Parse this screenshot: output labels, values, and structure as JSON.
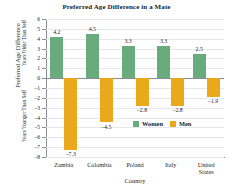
{
  "chart_data": {
    "type": "bar",
    "title": "Preferred Age Difference in a Mate",
    "xlabel": "Country",
    "ylabel": "Preferred Age Difference",
    "ylabel_upper": "Years Older Than Self",
    "ylabel_lower": "Years Younger Than Self",
    "categories": [
      "Zambia",
      "Colombia",
      "Poland",
      "Italy",
      "United States"
    ],
    "series": [
      {
        "name": "Women",
        "color": "#6aab7e",
        "values": [
          4.2,
          4.5,
          3.3,
          3.3,
          2.5
        ]
      },
      {
        "name": "Men",
        "color": "#eaa81c",
        "values": [
          -7.3,
          -4.5,
          -2.8,
          -2.8,
          -1.9
        ]
      }
    ],
    "ylim": [
      -8,
      6
    ],
    "yticks": [
      6,
      5,
      4,
      3,
      2,
      1,
      0,
      -1,
      -2,
      -3,
      -4,
      -5,
      -6,
      -7,
      -8
    ],
    "ytick_labels": [
      "6",
      "5",
      "4",
      "3",
      "2",
      "1",
      "0",
      "–1",
      "–2",
      "–3",
      "–4",
      "–5",
      "–6",
      "–7",
      "–8"
    ],
    "value_labels": {
      "women": [
        "4.2",
        "4.5",
        "3.3",
        "3.3",
        "2.5"
      ],
      "men": [
        "–7.3",
        "–4.5",
        "–2.8",
        "–2.8",
        "–1.9"
      ]
    },
    "category_lines": [
      [
        "Zambia"
      ],
      [
        "Colombia"
      ],
      [
        "Poland"
      ],
      [
        "Italy"
      ],
      [
        "United",
        "States"
      ]
    ],
    "grid": true,
    "legend_position": "inside-lower-right",
    "legend": [
      "Women",
      "Men"
    ]
  }
}
